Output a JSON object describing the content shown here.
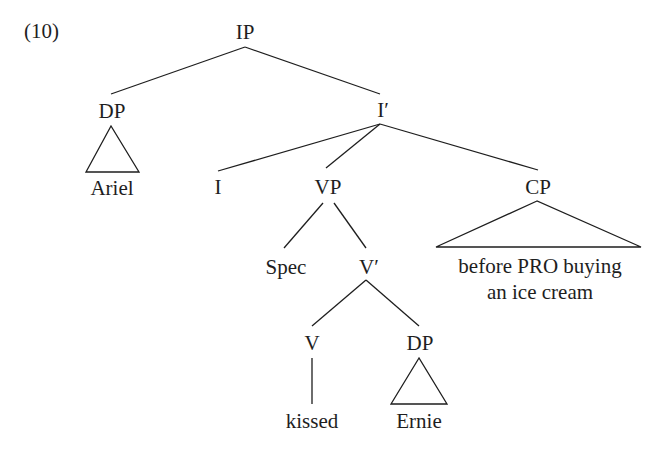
{
  "example_number": "(10)",
  "nodes": {
    "ip": "IP",
    "dp_subject": "DP",
    "ariel": "Ariel",
    "i_bar": "I′",
    "i": "I",
    "vp": "VP",
    "cp": "CP",
    "cp_text_line1": "before PRO buying",
    "cp_text_line2": "an ice cream",
    "spec": "Spec",
    "v_bar": "V′",
    "v": "V",
    "dp_object": "DP",
    "kissed": "kissed",
    "ernie": "Ernie"
  },
  "colors": {
    "ink": "#1e1e1e",
    "background": "#ffffff"
  }
}
